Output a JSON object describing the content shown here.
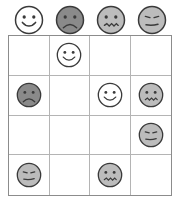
{
  "puzzle": {
    "type": "face-grid-puzzle",
    "grid_size": {
      "columns": 4,
      "rows": 4
    },
    "colors": {
      "face_white_fill": "#ffffff",
      "face_light_fill": "#bcbcbc",
      "face_dark_fill": "#8a8a8a",
      "outline": "#3a3a3a",
      "grid_outer_border": "#8c8c8c",
      "grid_inner_line": "#b4b4b4",
      "cell_background": "#ffffff"
    },
    "header": {
      "label": "Face legend row",
      "faces": [
        {
          "icon": "happy-face-icon",
          "expression": "happy",
          "fill": "white"
        },
        {
          "icon": "sad-face-icon",
          "expression": "sad",
          "fill": "dark"
        },
        {
          "icon": "confused-face-icon",
          "expression": "confused",
          "fill": "light"
        },
        {
          "icon": "neutral-face-icon",
          "expression": "neutral",
          "fill": "light"
        }
      ]
    },
    "grid": {
      "label": "Face placement grid",
      "rows": [
        [
          {
            "icon": "empty-cell",
            "expression": null,
            "fill": null
          },
          {
            "icon": "happy-face-icon",
            "expression": "happy",
            "fill": "white"
          },
          {
            "icon": "empty-cell",
            "expression": null,
            "fill": null
          },
          {
            "icon": "empty-cell",
            "expression": null,
            "fill": null
          }
        ],
        [
          {
            "icon": "sad-face-icon",
            "expression": "sad",
            "fill": "dark"
          },
          {
            "icon": "empty-cell",
            "expression": null,
            "fill": null
          },
          {
            "icon": "happy-face-icon",
            "expression": "happy",
            "fill": "white"
          },
          {
            "icon": "confused-face-icon",
            "expression": "confused",
            "fill": "light"
          }
        ],
        [
          {
            "icon": "empty-cell",
            "expression": null,
            "fill": null
          },
          {
            "icon": "empty-cell",
            "expression": null,
            "fill": null
          },
          {
            "icon": "empty-cell",
            "expression": null,
            "fill": null
          },
          {
            "icon": "neutral-face-icon",
            "expression": "neutral",
            "fill": "light"
          }
        ],
        [
          {
            "icon": "neutral-face-icon",
            "expression": "neutral",
            "fill": "light"
          },
          {
            "icon": "empty-cell",
            "expression": null,
            "fill": null
          },
          {
            "icon": "confused-face-icon",
            "expression": "confused",
            "fill": "light"
          },
          {
            "icon": "empty-cell",
            "expression": null,
            "fill": null
          }
        ]
      ]
    }
  }
}
